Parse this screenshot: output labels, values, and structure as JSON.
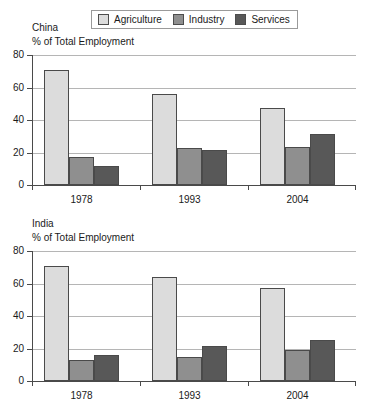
{
  "legend": {
    "items": [
      {
        "label": "Agriculture",
        "color": "#dcdcdc",
        "key": "agriculture"
      },
      {
        "label": "Industry",
        "color": "#8f8f8f",
        "key": "industry"
      },
      {
        "label": "Services",
        "color": "#585858",
        "key": "services"
      }
    ]
  },
  "axis": {
    "y_ticks": [
      "0",
      "20",
      "40",
      "60",
      "80"
    ],
    "y_title": "% of Total Employment"
  },
  "panels": [
    {
      "country": "China",
      "axis_title": "% of Total Employment"
    },
    {
      "country": "India",
      "axis_title": "% of Total Employment"
    }
  ],
  "chart_data": [
    {
      "type": "bar",
      "title": "China",
      "subtitle": "% of Total Employment",
      "xlabel": "",
      "ylabel": "% of Total Employment",
      "ylim": [
        0,
        80
      ],
      "yticks": [
        0,
        20,
        40,
        60,
        80
      ],
      "grid": true,
      "legend_position": "top",
      "categories": [
        "1978",
        "1993",
        "2004"
      ],
      "series": [
        {
          "name": "Agriculture",
          "color": "#dcdcdc",
          "values": [
            71,
            56,
            47.5
          ]
        },
        {
          "name": "Industry",
          "color": "#8f8f8f",
          "values": [
            17,
            22.5,
            23.5
          ]
        },
        {
          "name": "Services",
          "color": "#585858",
          "values": [
            12,
            21.5,
            31.5
          ]
        }
      ]
    },
    {
      "type": "bar",
      "title": "India",
      "subtitle": "% of Total Employment",
      "xlabel": "",
      "ylabel": "% of Total Employment",
      "ylim": [
        0,
        80
      ],
      "yticks": [
        0,
        20,
        40,
        60,
        80
      ],
      "grid": true,
      "legend_position": "top",
      "categories": [
        "1978",
        "1993",
        "2004"
      ],
      "series": [
        {
          "name": "Agriculture",
          "color": "#dcdcdc",
          "values": [
            71,
            64,
            57.5
          ]
        },
        {
          "name": "Industry",
          "color": "#8f8f8f",
          "values": [
            13,
            15,
            19
          ]
        },
        {
          "name": "Services",
          "color": "#585858",
          "values": [
            16,
            21.5,
            25.5
          ]
        }
      ]
    }
  ]
}
